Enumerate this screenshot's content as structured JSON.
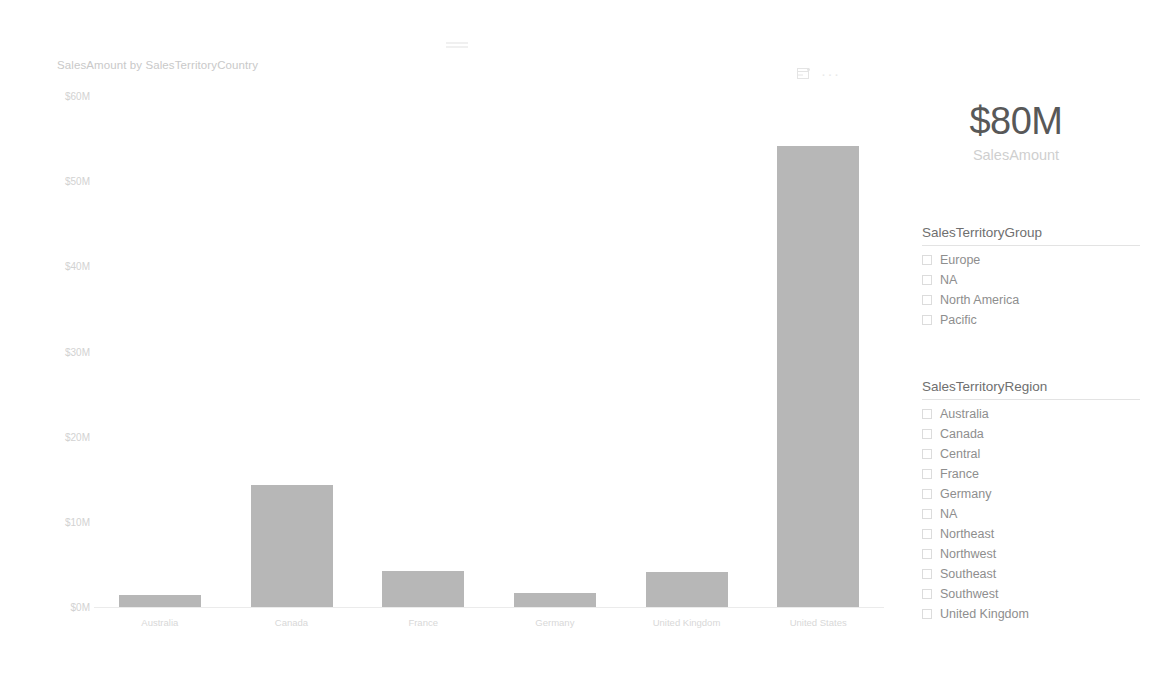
{
  "chart_visual": {
    "title": "SalesAmount by SalesTerritoryCountry",
    "icons": {
      "drill": "drill-mode-icon",
      "focus": "focus-mode-icon",
      "more": "more-options-icon",
      "more_glyph": "···"
    }
  },
  "chart_data": {
    "type": "bar",
    "title": "SalesAmount by SalesTerritoryCountry",
    "xlabel": "SalesTerritoryCountry",
    "ylabel": "SalesAmount",
    "categories": [
      "Australia",
      "Canada",
      "France",
      "Germany",
      "United Kingdom",
      "United States"
    ],
    "values": [
      1.4,
      14.3,
      4.2,
      1.6,
      4.1,
      54.1
    ],
    "value_unit": "$M",
    "ylim": [
      0,
      60
    ],
    "yticks": [
      0,
      10,
      20,
      30,
      40,
      50,
      60
    ],
    "ytick_labels": [
      "$0M",
      "$10M",
      "$20M",
      "$30M",
      "$40M",
      "$50M",
      "$60M"
    ],
    "grid": false,
    "legend": "none",
    "bar_color": "#b7b7b7"
  },
  "kpi_card": {
    "value": "$80M",
    "label": "SalesAmount"
  },
  "slicers": [
    {
      "name": "sales-territory-group",
      "title": "SalesTerritoryGroup",
      "items": [
        {
          "label": "Europe",
          "checked": false
        },
        {
          "label": "NA",
          "checked": false
        },
        {
          "label": "North America",
          "checked": false
        },
        {
          "label": "Pacific",
          "checked": false
        }
      ]
    },
    {
      "name": "sales-territory-region",
      "title": "SalesTerritoryRegion",
      "items": [
        {
          "label": "Australia",
          "checked": false
        },
        {
          "label": "Canada",
          "checked": false
        },
        {
          "label": "Central",
          "checked": false
        },
        {
          "label": "France",
          "checked": false
        },
        {
          "label": "Germany",
          "checked": false
        },
        {
          "label": "NA",
          "checked": false
        },
        {
          "label": "Northeast",
          "checked": false
        },
        {
          "label": "Northwest",
          "checked": false
        },
        {
          "label": "Southeast",
          "checked": false
        },
        {
          "label": "Southwest",
          "checked": false
        },
        {
          "label": "United Kingdom",
          "checked": false
        }
      ]
    }
  ]
}
